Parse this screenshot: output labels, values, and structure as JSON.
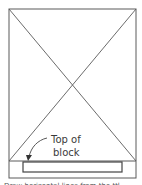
{
  "diagram": {
    "label_line1": "Top of",
    "label_line2": "block",
    "caption_partial": "Draw horizontal lines from the ttl",
    "colors": {
      "stroke": "#555555",
      "block": "#444444",
      "background": "#ffffff"
    }
  }
}
